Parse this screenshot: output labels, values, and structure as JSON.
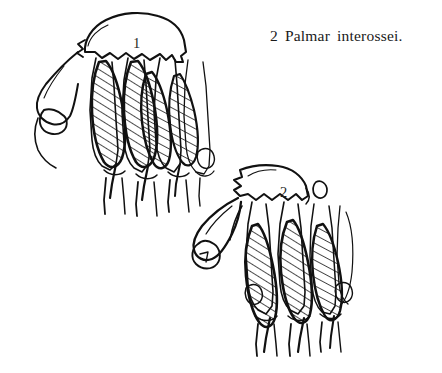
{
  "page": {
    "background_color": "#ffffff",
    "ink_color": "#111111",
    "width": 442,
    "height": 373,
    "kind": "anatomical-line-drawing"
  },
  "caption": {
    "number": "2",
    "word1": "Palmar",
    "word2": "interossei.",
    "full_text": "2 Palmar interossei."
  },
  "figures": [
    {
      "id": "figure-1",
      "label": "1",
      "view": "palmar view of hand skeleton, dorsal-side carpal dome at top",
      "hatched_muscle_count": 4,
      "description": "Four hatched palmar interosseous muscle bellies between metacarpals, thumb metacarpal base at left"
    },
    {
      "id": "figure-2",
      "label": "2",
      "view": "oblique palmar view of hand skeleton, thumb metacarpal projecting to lower left",
      "hatched_muscle_count": 3,
      "description": "Three hatched palmar interosseous muscle bellies between metacarpals, detached small carpal bone at upper right"
    }
  ],
  "icons": {
    "figure_one_label": "numeral-one-label",
    "figure_two_label": "numeral-two-label"
  }
}
